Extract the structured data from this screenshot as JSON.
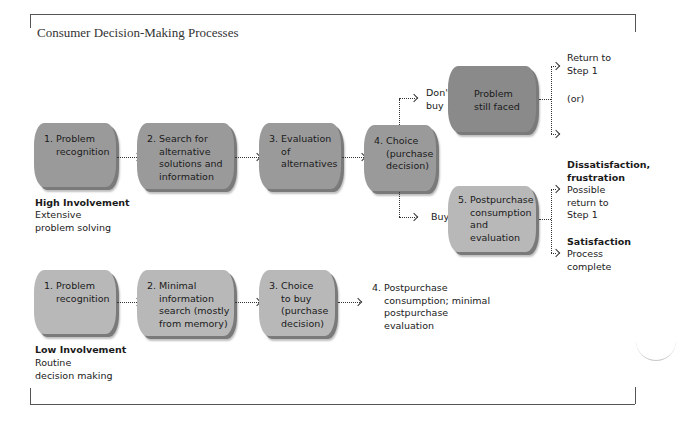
{
  "title": "Consumer Decision-Making Processes",
  "high_involvement": {
    "heading": "High Involvement",
    "description_line1": "Extensive",
    "description_line2": "problem solving",
    "steps": [
      {
        "label": "1. Problem\n    recognition"
      },
      {
        "label": "2. Search for\n    alternative\n    solutions and\n    information"
      },
      {
        "label": "3. Evaluation\n    of\n    alternatives"
      },
      {
        "label": "4. Choice\n    (purchase\n    decision)"
      }
    ],
    "branch_dont_buy": {
      "edge_label": "Don't\nbuy",
      "box_label": "Problem\nstill faced",
      "outcome_top": "Return to\nStep 1",
      "outcome_or": "(or)",
      "outcome_bottom": "Stop"
    },
    "branch_buy": {
      "edge_label": "Buy",
      "box_label": "5. Postpurchase\n    consumption\n    and\n    evaluation",
      "dissatisfaction_heading": "Dissatisfaction,\nfrustration",
      "dissatisfaction_outcome": "Possible\nreturn to\nStep 1",
      "satisfaction_heading": "Satisfaction",
      "satisfaction_outcome": "Process\ncomplete"
    }
  },
  "low_involvement": {
    "heading": "Low Involvement",
    "description_line1": "Routine",
    "description_line2": "decision making",
    "steps": [
      {
        "label": "1. Problem\n    recognition"
      },
      {
        "label": "2. Minimal\n    information\n    search (mostly\n    from memory)"
      },
      {
        "label": "3. Choice\n    to buy\n    (purchase\n    decision)"
      }
    ],
    "final_step": "4. Postpurchase\n    consumption; minimal\n    postpurchase\n    evaluation"
  },
  "colors": {
    "box_dark": "#8a8a8a",
    "box_mid": "#9a9a9a",
    "box_light": "#b8b8b8",
    "frame": "#555555"
  }
}
